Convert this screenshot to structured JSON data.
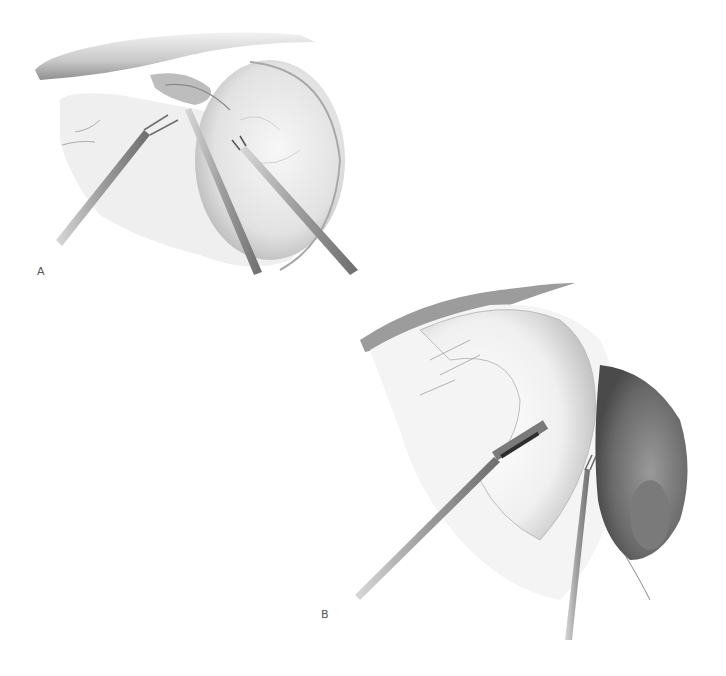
{
  "figure": {
    "panels": [
      {
        "label": "A",
        "description": "Laparoscopic view: three instruments retracting tissue beneath liver edge, grasper on stomach wall"
      },
      {
        "label": "B",
        "description": "Laparoscopic view: grasper and dissector instruments on curved stomach with dark viscera on right"
      }
    ],
    "colors": {
      "background": "#ffffff",
      "tissue_light": "#e6e6e6",
      "tissue_mid": "#bdbdbd",
      "tissue_dark": "#6e6e6e",
      "instrument": "#9a9a9a",
      "label": "#555555"
    }
  }
}
